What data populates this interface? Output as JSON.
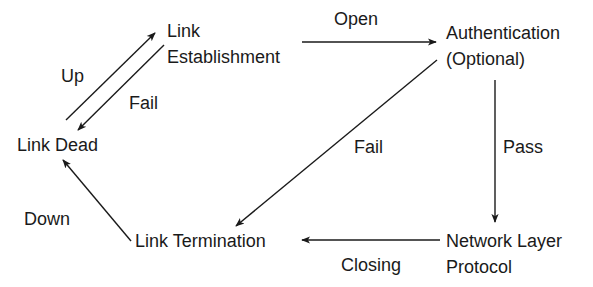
{
  "diagram": {
    "nodes": {
      "link_establishment": {
        "lines": [
          "Link",
          "Establishment"
        ]
      },
      "authentication": {
        "lines": [
          "Authentication",
          "(Optional)"
        ]
      },
      "link_dead": {
        "lines": [
          "Link Dead"
        ]
      },
      "network_layer_protocol": {
        "lines": [
          "Network Layer",
          "Protocol"
        ]
      },
      "link_termination": {
        "lines": [
          "Link Termination"
        ]
      }
    },
    "edges": {
      "up": {
        "from": "Link Dead",
        "to": "Link Establishment",
        "label": "Up"
      },
      "fail_establishment": {
        "from": "Link Establishment",
        "to": "Link Dead",
        "label": "Fail"
      },
      "open": {
        "from": "Link Establishment",
        "to": "Authentication (Optional)",
        "label": "Open"
      },
      "fail_auth": {
        "from": "Authentication (Optional)",
        "to": "Link Termination",
        "label": "Fail"
      },
      "pass": {
        "from": "Authentication (Optional)",
        "to": "Network Layer Protocol",
        "label": "Pass"
      },
      "closing": {
        "from": "Network Layer Protocol",
        "to": "Link Termination",
        "label": "Closing"
      },
      "down": {
        "from": "Link Termination",
        "to": "Link Dead",
        "label": "Down"
      }
    },
    "colors": {
      "ink": "#1a1a1a",
      "background": "#ffffff"
    }
  }
}
